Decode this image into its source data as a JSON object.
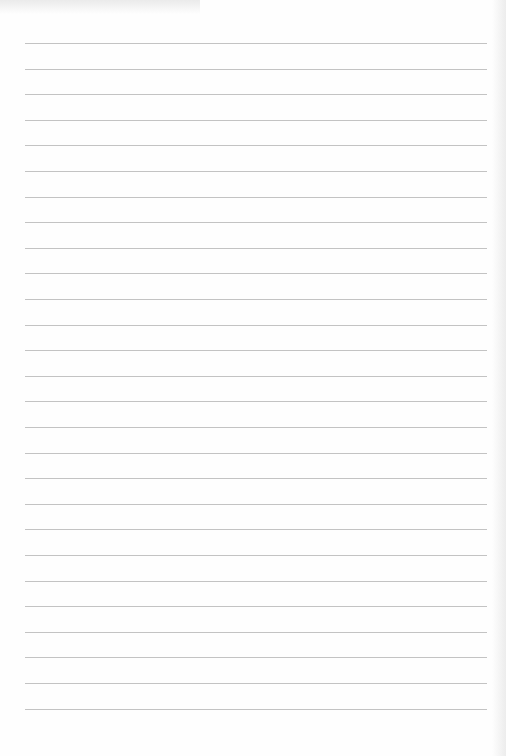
{
  "document": {
    "type": "lined-paper",
    "line_count": 27,
    "first_line_y": 43,
    "line_spacing": 25.6,
    "line_left": 25,
    "line_width": 462,
    "line_color": "#b9b9b9",
    "paper_color": "#fefefe"
  }
}
